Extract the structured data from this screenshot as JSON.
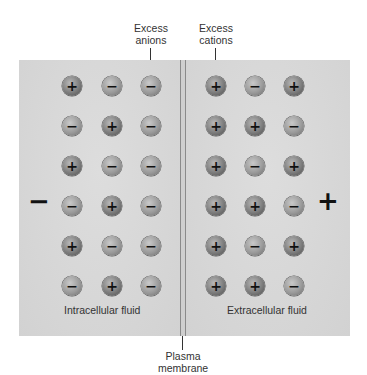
{
  "labels": {
    "excess_anions": "Excess\nanions",
    "excess_anions_line1": "Excess",
    "excess_anions_line2": "anions",
    "excess_cations_line1": "Excess",
    "excess_cations_line2": "cations",
    "plasma_membrane_line1": "Plasma",
    "plasma_membrane_line2": "membrane",
    "intracellular": "Intracellular fluid",
    "extracellular": "Extracellular fluid"
  },
  "side_charges": {
    "left": "−",
    "right": "+"
  },
  "ion_symbols": {
    "cation": "+",
    "anion": "−"
  },
  "intracellular_ions": [
    [
      "+",
      "−",
      "−"
    ],
    [
      "−",
      "+",
      "−"
    ],
    [
      "+",
      "−",
      "−"
    ],
    [
      "−",
      "+",
      "−"
    ],
    [
      "+",
      "−",
      "−"
    ],
    [
      "−",
      "+",
      "−"
    ]
  ],
  "extracellular_ions": [
    [
      "+",
      "−",
      "+"
    ],
    [
      "+",
      "+",
      "−"
    ],
    [
      "+",
      "−",
      "+"
    ],
    [
      "+",
      "+",
      "−"
    ],
    [
      "+",
      "−",
      "+"
    ],
    [
      "+",
      "+",
      "−"
    ]
  ],
  "colors": {
    "fluid_background": "#d6d6d6",
    "ion_fill": "#7c7c7c",
    "text": "#333333"
  }
}
